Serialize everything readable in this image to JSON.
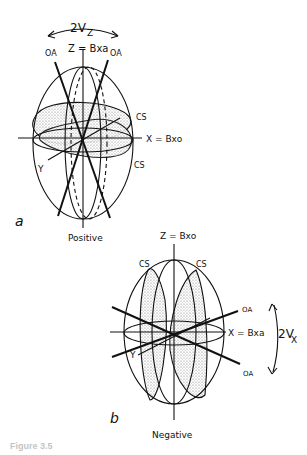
{
  "diagram_a": {
    "panel_label": "a",
    "sign_label": "Positive",
    "angle_label": "2V",
    "angle_subscript": "Z",
    "z_axis_label": "Z = Bxa",
    "x_axis_label": "X = Bxo",
    "y_axis_label": "Y",
    "optic_axis_labels": [
      "OA",
      "OA"
    ],
    "circular_section_labels": [
      "CS",
      "CS"
    ]
  },
  "diagram_b": {
    "panel_label": "b",
    "sign_label": "Negative",
    "angle_label": "2V",
    "angle_subscript": "X",
    "z_axis_label": "Z = Bxo",
    "x_axis_label": "X = Bxa",
    "y_axis_label": "Y",
    "optic_axis_labels": [
      "OA",
      "OA"
    ],
    "circular_section_labels": [
      "CS",
      "CS"
    ]
  },
  "caption": "Figure 3.5"
}
